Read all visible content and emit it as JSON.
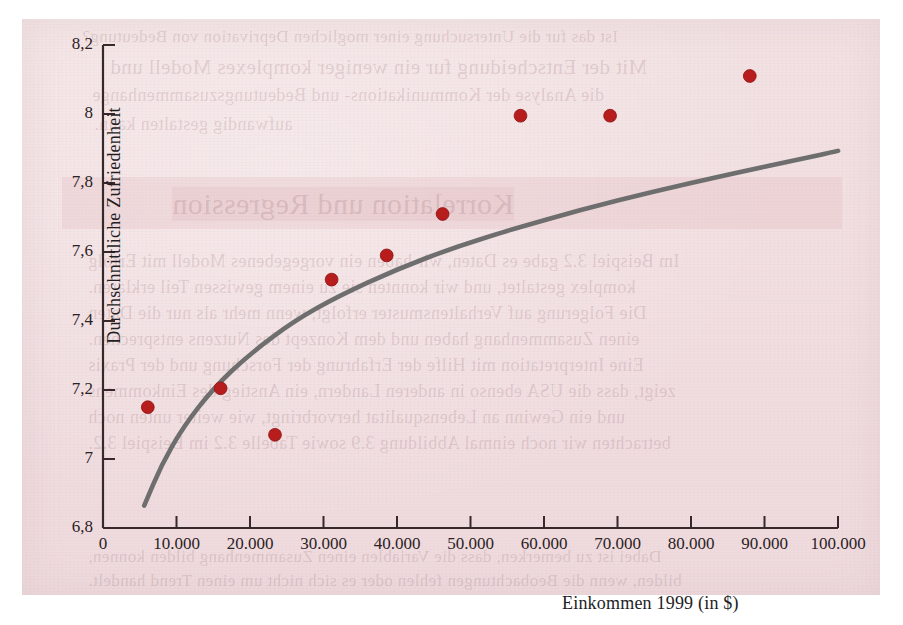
{
  "figure": {
    "background_color": "#f1dee0",
    "page_color": "#ffffff",
    "axis_color": "#37292b",
    "point_color": "#b81d1d",
    "curve_color": "#6e6e6e"
  },
  "chart_data": {
    "type": "scatter",
    "title": "",
    "xlabel": "Einkommen 1999  (in $)",
    "ylabel": "Durchschnittliche Zufriedenheit",
    "xlim": [
      0,
      100000
    ],
    "ylim": [
      6.8,
      8.2
    ],
    "grid": false,
    "legend": "none",
    "xtick_labels": [
      "0",
      "10.000",
      "20.000",
      "30.000",
      "40.000",
      "50.000",
      "60.000",
      "70.000",
      "80.000",
      "90.000",
      "100.000"
    ],
    "xtick_values": [
      0,
      10000,
      20000,
      30000,
      40000,
      50000,
      60000,
      70000,
      80000,
      90000,
      100000
    ],
    "ytick_labels": [
      "6,8",
      "7",
      "7,2",
      "7,4",
      "7,6",
      "7,8",
      "8",
      "8,2"
    ],
    "ytick_values": [
      6.8,
      7.0,
      7.2,
      7.4,
      7.6,
      7.8,
      8.0,
      8.2
    ],
    "points": [
      {
        "x": 6100,
        "y": 7.15
      },
      {
        "x": 16000,
        "y": 7.205
      },
      {
        "x": 23400,
        "y": 7.07
      },
      {
        "x": 31100,
        "y": 7.52
      },
      {
        "x": 38600,
        "y": 7.59
      },
      {
        "x": 46200,
        "y": 7.71
      },
      {
        "x": 56800,
        "y": 7.995
      },
      {
        "x": 69000,
        "y": 7.995
      },
      {
        "x": 88000,
        "y": 8.11
      }
    ],
    "fit_curve": {
      "name": "logarithmische Anpassung",
      "points": [
        {
          "x": 5600,
          "y": 6.865
        },
        {
          "x": 8000,
          "y": 6.985
        },
        {
          "x": 11000,
          "y": 7.095
        },
        {
          "x": 15000,
          "y": 7.205
        },
        {
          "x": 20000,
          "y": 7.305
        },
        {
          "x": 26000,
          "y": 7.4
        },
        {
          "x": 32000,
          "y": 7.472
        },
        {
          "x": 40000,
          "y": 7.55
        },
        {
          "x": 48000,
          "y": 7.615
        },
        {
          "x": 56000,
          "y": 7.668
        },
        {
          "x": 65000,
          "y": 7.722
        },
        {
          "x": 75000,
          "y": 7.776
        },
        {
          "x": 85000,
          "y": 7.824
        },
        {
          "x": 95000,
          "y": 7.87
        },
        {
          "x": 100000,
          "y": 7.893
        }
      ]
    }
  },
  "bleed_text": {
    "lines": [
      {
        "text": "Ist das fur die Untersuchung einer moglichen Deprivation von Bedeutung?",
        "x": 60,
        "y": 8,
        "size": 17
      },
      {
        "text": "Mit der Entscheidung fur ein weniger komplexes Modell und",
        "x": 88,
        "y": 36,
        "size": 21
      },
      {
        "text": "die Analyse der Kommunikations- und Bedeutungszusammenhange",
        "x": 70,
        "y": 66,
        "size": 18
      },
      {
        "text": "aufwandig gestalten kann.",
        "x": 72,
        "y": 95,
        "size": 18
      },
      {
        "text": "Korrelation und Regression",
        "x": 150,
        "y": 168,
        "size": 30,
        "band": true
      },
      {
        "text": "Im Beispiel 3.2 gabe es Daten, wir haben ein vorgegebenes Modell mit Erfolg",
        "x": 66,
        "y": 232,
        "size": 18
      },
      {
        "text": "komplex gestaltet, und wir konnten sie zu einem gewissen Teil erklaren.",
        "x": 66,
        "y": 258,
        "size": 18
      },
      {
        "text": "Die Folgerung auf Verhaltensmuster erfolgt, wenn mehr als nur die Daten",
        "x": 66,
        "y": 284,
        "size": 18
      },
      {
        "text": "einen Zusammenhang haben und dem Konzept des Nutzens entsprechen.",
        "x": 66,
        "y": 310,
        "size": 18
      },
      {
        "text": "Eine Interpretation mit Hilfe der Erfahrung der Forschung und der Praxis",
        "x": 66,
        "y": 336,
        "size": 18
      },
      {
        "text": "zeigt, dass die USA ebenso in anderen Landern, ein Anstieg des Einkommens",
        "x": 66,
        "y": 362,
        "size": 18
      },
      {
        "text": "und ein Gewinn an Lebensqualitat hervorbringt, wie weiter unten noch",
        "x": 66,
        "y": 388,
        "size": 18
      },
      {
        "text": "betrachten wir noch einmal Abbildung 3.9 sowie Tabelle 3.2 im Beispiel 3.2.",
        "x": 66,
        "y": 414,
        "size": 18
      },
      {
        "text": "Dabei ist zu bemerken, dass die Variablen einen Zusammenhang bilden konnen,",
        "x": 66,
        "y": 528,
        "size": 17
      },
      {
        "text": "bilden, wenn die Beobachtungen fehlen oder es sich nicht um einen Trend handelt.",
        "x": 66,
        "y": 552,
        "size": 17
      }
    ]
  }
}
